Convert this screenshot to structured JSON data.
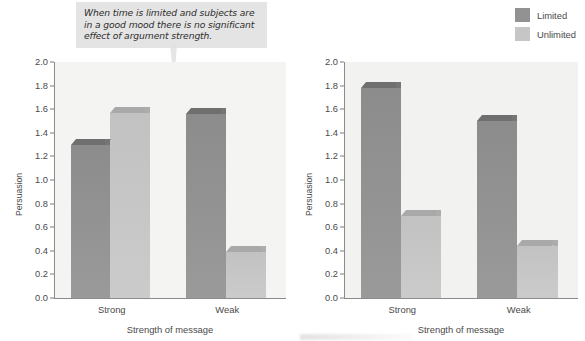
{
  "callout": {
    "text": "When time is limited and subjects are in a good mood there is no significant effect of argument strength."
  },
  "legend": {
    "position": "top-right",
    "items": [
      {
        "label": "Limited",
        "color": "#929292"
      },
      {
        "label": "Unlimited",
        "color": "#c6c6c6"
      }
    ]
  },
  "chart_data": [
    {
      "id": "left",
      "type": "bar",
      "title": "",
      "xlabel": "Strength of message",
      "ylabel": "Persuasion",
      "categories": [
        "Strong",
        "Weak"
      ],
      "ylim": [
        0.0,
        2.0
      ],
      "yticks": [
        "0.0",
        "0.2",
        "0.4",
        "0.6",
        "0.8",
        "1.0",
        "1.2",
        "1.4",
        "1.6",
        "1.8",
        "2.0"
      ],
      "grid": false,
      "series": [
        {
          "name": "Limited",
          "color": "#929292",
          "values": [
            1.35,
            1.61
          ]
        },
        {
          "name": "Unlimited",
          "color": "#c6c6c6",
          "values": [
            1.62,
            0.44
          ]
        }
      ]
    },
    {
      "id": "right",
      "type": "bar",
      "title": "",
      "xlabel": "Strength of message",
      "ylabel": "Persuasion",
      "categories": [
        "Strong",
        "Weak"
      ],
      "ylim": [
        0.0,
        2.0
      ],
      "yticks": [
        "0.0",
        "0.2",
        "0.4",
        "0.6",
        "0.8",
        "1.0",
        "1.2",
        "1.4",
        "1.6",
        "1.8",
        "2.0"
      ],
      "grid": false,
      "series": [
        {
          "name": "Limited",
          "color": "#929292",
          "values": [
            1.83,
            1.55
          ]
        },
        {
          "name": "Unlimited",
          "color": "#c6c6c6",
          "values": [
            0.75,
            0.49
          ]
        }
      ]
    }
  ]
}
